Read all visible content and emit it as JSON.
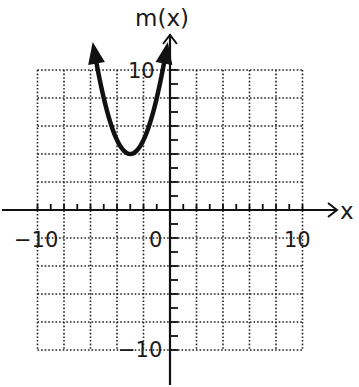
{
  "chart_data": {
    "type": "line",
    "title": "",
    "function_label": "m(x)",
    "xlabel": "x",
    "ylabel": "m(x)",
    "xlim": [
      -10,
      10
    ],
    "ylim": [
      -10,
      10
    ],
    "grid": true,
    "grid_step": 2,
    "tick_step": 1,
    "tick_labels": {
      "x": [
        {
          "value": -10,
          "text": "-10"
        },
        {
          "value": 0,
          "text": "0"
        },
        {
          "value": 10,
          "text": "10"
        }
      ],
      "y": [
        {
          "value": 10,
          "text": "10"
        },
        {
          "value": -10,
          "text": "-10"
        }
      ]
    },
    "series": [
      {
        "name": "m(x) = (x+3)^2 + 4",
        "equation": "m(x) = (x + 3)^2 + 4",
        "vertex": [
          -3,
          4
        ],
        "x_range": [
          -5.65,
          -0.35
        ],
        "arrows_both_ends": true,
        "x": [
          -5.65,
          -5,
          -4,
          -3,
          -2,
          -1,
          -0.35
        ],
        "y": [
          11.0,
          8,
          5,
          4,
          5,
          8,
          11.0
        ]
      }
    ],
    "legend": null
  },
  "colors": {
    "ink": "#111111",
    "grid": "#222222",
    "background": "#ffffff"
  },
  "labels": {
    "y_axis": "m(x)",
    "x_axis": "x",
    "x_neg10": "−10",
    "x_zero": "0",
    "x_pos10": "10",
    "y_pos10": "10",
    "y_neg10": "−10"
  }
}
